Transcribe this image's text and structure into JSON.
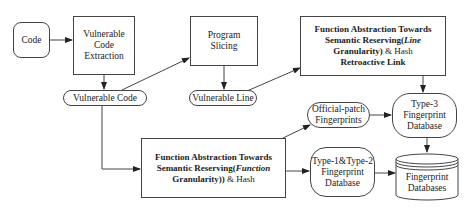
{
  "diagram": {
    "nodes": {
      "code": {
        "label": "Code"
      },
      "extraction": {
        "line1": "Vulnerable",
        "line2": "Code",
        "line3": "Extraction"
      },
      "vuln_code": {
        "label": "Vulnerable Code"
      },
      "slicing": {
        "line1": "Program",
        "line2": "Slicing"
      },
      "vuln_line": {
        "label": "Vulnerable Line"
      },
      "line_abs": {
        "line1": "Function Abstraction Towards",
        "line2_prefix": "Semantic Reserving(",
        "line2_italic": "Line",
        "line3_bold": "Granularity)",
        "line3_rest": " & Hash",
        "line4": "Retroactive Link"
      },
      "func_abs": {
        "line1": "Function Abstraction Towards",
        "line2_prefix": "Semantic Reserving(",
        "line2_italic": "Function",
        "line3_bold": "Granularity))",
        "line3_rest": " & Hash"
      },
      "official_patch": {
        "line1": "Official-patch",
        "line2": "Fingerprints"
      },
      "type3": {
        "line1": "Type-3",
        "line2": "Fingerprint",
        "line3": "Database"
      },
      "type12": {
        "line1": "Type-1&Type-2",
        "line2": "Fingerprint",
        "line3": "Database"
      },
      "fp_dbs": {
        "line1": "Fingerprint",
        "line2": "Databases"
      }
    },
    "edges": [
      {
        "from": "Code",
        "to": "Vulnerable Code Extraction"
      },
      {
        "from": "Vulnerable Code Extraction",
        "to": "Vulnerable Code"
      },
      {
        "from": "Vulnerable Code",
        "to": "Program Slicing"
      },
      {
        "from": "Program Slicing",
        "to": "Vulnerable Line"
      },
      {
        "from": "Vulnerable Line",
        "to": "Function Abstraction (Line Granularity)"
      },
      {
        "from": "Function Abstraction (Line Granularity)",
        "to": "Type-3 Fingerprint Database"
      },
      {
        "from": "Vulnerable Code",
        "to": "Function Abstraction (Function Granularity)"
      },
      {
        "from": "Function Abstraction (Function Granularity)",
        "to": "Official-patch Fingerprints"
      },
      {
        "from": "Official-patch Fingerprints",
        "to": "Type-3 Fingerprint Database"
      },
      {
        "from": "Function Abstraction (Function Granularity)",
        "to": "Type-1&Type-2 Fingerprint Database"
      },
      {
        "from": "Type-3 Fingerprint Database",
        "to": "Fingerprint Databases"
      },
      {
        "from": "Type-1&Type-2 Fingerprint Database",
        "to": "Fingerprint Databases"
      }
    ],
    "colors": {
      "stroke": "#444444",
      "text": "#222222",
      "background": "#ffffff"
    }
  }
}
